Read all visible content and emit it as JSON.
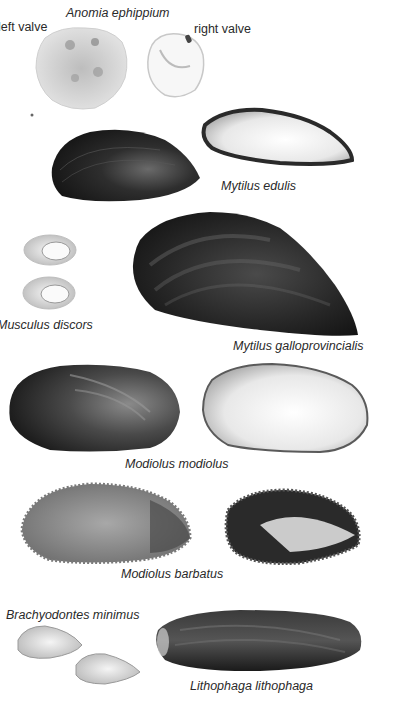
{
  "plate": {
    "background": "#ffffff",
    "species": [
      {
        "id": "anomia",
        "name": "Anomia ephippium",
        "views": [
          "left valve",
          "right valve"
        ]
      },
      {
        "id": "mytilus-edulis",
        "name": "Mytilus edulis"
      },
      {
        "id": "musculus",
        "name": "Musculus discors",
        "display_name": "Musculus discors"
      },
      {
        "id": "mytilus-gallo",
        "name": "Mytilus galloprovincialis"
      },
      {
        "id": "modiolus-modiolus",
        "name": "Modiolus modiolus"
      },
      {
        "id": "modiolus-barbatus",
        "name": "Modiolus barbatus"
      },
      {
        "id": "brachyodontes",
        "name": "Brachyodontes minimus"
      },
      {
        "id": "lithophaga",
        "name": "Lithophaga lithophaga"
      }
    ]
  },
  "labels": {
    "anomia_title": "Anomia ephippium",
    "left_valve": "left valve",
    "right_valve": "right valve",
    "mytilus_edulis": "Mytilus edulis",
    "musculus_discors": "Musculus discors",
    "mytilus_gallo": "Mytilus galloprovincialis",
    "modiolus_modiolus": "Modiolus modiolus",
    "modiolus_barbatus": "Modiolus barbatus",
    "brachyodontes": "Brachyodontes minimus",
    "lithophaga": "Lithophaga lithophaga"
  },
  "colors": {
    "dark_shell": "#1c1c1c",
    "mid_shell": "#5a5a5a",
    "light_interior": "#f2f2f2",
    "label_text": "#2a2a2a"
  }
}
